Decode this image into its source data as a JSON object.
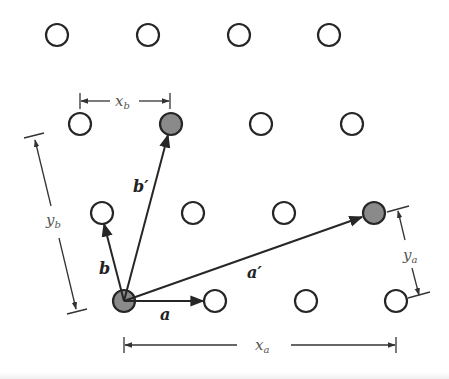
{
  "diagram": {
    "colors": {
      "stroke": "#262626",
      "open_fill": "#ffffff",
      "filled": "#8a8a8a",
      "dim_text": "#555555",
      "vec_text": "#222222"
    },
    "open_lattice_points": [
      {
        "x": 57,
        "y": 35
      },
      {
        "x": 148,
        "y": 35
      },
      {
        "x": 239,
        "y": 35
      },
      {
        "x": 329,
        "y": 35
      },
      {
        "x": 80,
        "y": 124
      },
      {
        "x": 261,
        "y": 124
      },
      {
        "x": 352,
        "y": 124
      },
      {
        "x": 102,
        "y": 213
      },
      {
        "x": 193,
        "y": 213
      },
      {
        "x": 284,
        "y": 213
      },
      {
        "x": 215,
        "y": 301
      },
      {
        "x": 306,
        "y": 301
      },
      {
        "x": 396,
        "y": 301
      }
    ],
    "filled_lattice_points": [
      {
        "name": "origin",
        "x": 124,
        "y": 301
      },
      {
        "name": "b-prime-tip",
        "x": 171,
        "y": 124
      },
      {
        "name": "a-prime-tip",
        "x": 374,
        "y": 213
      }
    ],
    "vectors": {
      "a": {
        "label": "a",
        "prime": ""
      },
      "b": {
        "label": "b",
        "prime": ""
      },
      "a_prime": {
        "label": "a",
        "prime": "′"
      },
      "b_prime": {
        "label": "b",
        "prime": "′"
      }
    },
    "dimensions": {
      "x_a": {
        "main": "x",
        "sub": "a"
      },
      "y_a": {
        "main": "y",
        "sub": "a"
      },
      "x_b": {
        "main": "x",
        "sub": "b"
      },
      "y_b": {
        "main": "y",
        "sub": "b"
      }
    }
  }
}
